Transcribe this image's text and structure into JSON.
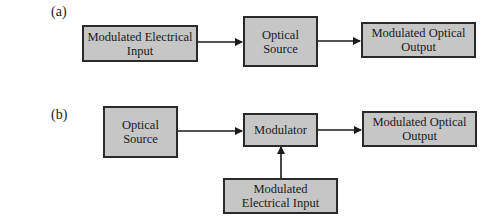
{
  "diagram_a": {
    "label": "(a)",
    "boxes": [
      {
        "text": "Modulated Electrical Input"
      },
      {
        "text": "Optical Source"
      },
      {
        "text": "Modulated Optical Output"
      }
    ]
  },
  "diagram_b": {
    "label": "(b)",
    "boxes": [
      {
        "text": "Optical Source"
      },
      {
        "text": "Modulator"
      },
      {
        "text": "Modulated Optical Output"
      },
      {
        "text": "Modulated Electrical Input"
      }
    ]
  },
  "colors": {
    "box_fill": "#c6c6c6",
    "stroke": "#2a2a2a"
  }
}
